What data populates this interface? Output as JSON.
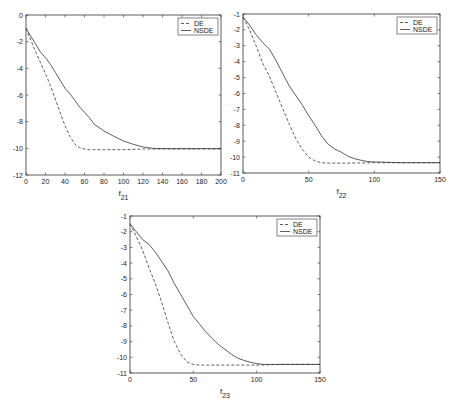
{
  "chart_data": [
    {
      "type": "line",
      "id": "f21",
      "xlabel": "f",
      "xlabel_sub": "21",
      "ylabel": "",
      "title": "",
      "xlim": [
        0,
        200
      ],
      "ylim": [
        -12,
        0
      ],
      "xticks": [
        0,
        20,
        40,
        60,
        80,
        100,
        120,
        140,
        160,
        180,
        200
      ],
      "yticks": [
        0,
        -2,
        -4,
        -6,
        -8,
        -10,
        -12
      ],
      "grid": false,
      "legend_position": "upper right",
      "box": {
        "left": 26,
        "top": 15,
        "right": 221,
        "bottom": 175
      },
      "series": [
        {
          "name": "DE",
          "style": "dashed",
          "x": [
            0,
            5,
            10,
            15,
            20,
            25,
            30,
            35,
            40,
            45,
            50,
            55,
            60,
            65,
            70,
            80,
            100,
            120,
            140,
            160,
            180,
            200
          ],
          "y": [
            -1.0,
            -1.9,
            -2.8,
            -3.6,
            -4.4,
            -5.3,
            -6.3,
            -7.3,
            -8.3,
            -9.1,
            -9.7,
            -9.95,
            -10.05,
            -10.1,
            -10.1,
            -10.1,
            -10.1,
            -10.05,
            -10.05,
            -10.05,
            -10.05,
            -10.05
          ]
        },
        {
          "name": "NSDE",
          "style": "solid",
          "x": [
            0,
            5,
            10,
            15,
            20,
            25,
            30,
            35,
            40,
            45,
            50,
            55,
            60,
            65,
            70,
            80,
            90,
            100,
            110,
            120,
            130,
            140,
            160,
            180,
            200
          ],
          "y": [
            -1.0,
            -1.6,
            -2.2,
            -2.8,
            -3.2,
            -3.7,
            -4.3,
            -4.9,
            -5.5,
            -5.9,
            -6.4,
            -6.9,
            -7.3,
            -7.7,
            -8.2,
            -8.7,
            -9.1,
            -9.45,
            -9.7,
            -9.9,
            -10.0,
            -10.02,
            -10.02,
            -10.02,
            -10.02
          ]
        }
      ]
    },
    {
      "type": "line",
      "id": "f22",
      "xlabel": "f",
      "xlabel_sub": "22",
      "ylabel": "",
      "title": "",
      "xlim": [
        0,
        150
      ],
      "ylim": [
        -11,
        -1
      ],
      "xticks": [
        0,
        50,
        100,
        150
      ],
      "yticks": [
        -1,
        -2,
        -3,
        -4,
        -5,
        -6,
        -7,
        -8,
        -9,
        -10,
        -11
      ],
      "grid": false,
      "legend_position": "upper right",
      "box": {
        "left": 243,
        "top": 14,
        "right": 440,
        "bottom": 173
      },
      "series": [
        {
          "name": "DE",
          "style": "dashed",
          "x": [
            0,
            5,
            10,
            15,
            20,
            25,
            30,
            35,
            40,
            45,
            50,
            55,
            60,
            65,
            70,
            80,
            100,
            120,
            150
          ],
          "y": [
            -1.2,
            -2.0,
            -3.0,
            -4.1,
            -4.9,
            -5.9,
            -6.9,
            -7.9,
            -8.8,
            -9.5,
            -10.0,
            -10.25,
            -10.35,
            -10.38,
            -10.38,
            -10.38,
            -10.35,
            -10.35,
            -10.35
          ]
        },
        {
          "name": "NSDE",
          "style": "solid",
          "x": [
            0,
            5,
            10,
            15,
            20,
            25,
            30,
            35,
            40,
            45,
            50,
            55,
            60,
            65,
            70,
            75,
            80,
            85,
            90,
            95,
            100,
            110,
            120,
            150
          ],
          "y": [
            -1.2,
            -1.7,
            -2.3,
            -2.8,
            -3.2,
            -3.9,
            -4.7,
            -5.5,
            -6.1,
            -6.7,
            -7.4,
            -8.0,
            -8.7,
            -9.2,
            -9.5,
            -9.7,
            -9.95,
            -10.1,
            -10.2,
            -10.28,
            -10.3,
            -10.33,
            -10.35,
            -10.35
          ]
        }
      ]
    },
    {
      "type": "line",
      "id": "f23",
      "xlabel": "f",
      "xlabel_sub": "23",
      "ylabel": "",
      "title": "",
      "xlim": [
        0,
        150
      ],
      "ylim": [
        -11,
        -1
      ],
      "xticks": [
        0,
        50,
        100,
        150
      ],
      "yticks": [
        -1,
        -2,
        -3,
        -4,
        -5,
        -6,
        -7,
        -8,
        -9,
        -10,
        -11
      ],
      "grid": false,
      "legend_position": "upper right",
      "box": {
        "left": 130,
        "top": 216,
        "right": 320,
        "bottom": 373
      },
      "series": [
        {
          "name": "DE",
          "style": "dashed",
          "x": [
            0,
            5,
            10,
            15,
            20,
            25,
            30,
            35,
            40,
            45,
            50,
            55,
            60,
            80,
            100,
            120,
            150
          ],
          "y": [
            -1.5,
            -2.3,
            -3.2,
            -4.3,
            -5.3,
            -6.5,
            -7.8,
            -9.0,
            -9.8,
            -10.3,
            -10.45,
            -10.5,
            -10.5,
            -10.5,
            -10.5,
            -10.45,
            -10.45
          ]
        },
        {
          "name": "NSDE",
          "style": "solid",
          "x": [
            0,
            5,
            10,
            15,
            20,
            25,
            30,
            35,
            40,
            45,
            50,
            55,
            60,
            65,
            70,
            75,
            80,
            85,
            90,
            95,
            100,
            105,
            110,
            120,
            150
          ],
          "y": [
            -1.5,
            -2.0,
            -2.5,
            -2.8,
            -3.3,
            -3.9,
            -4.5,
            -5.3,
            -6.0,
            -6.7,
            -7.4,
            -7.9,
            -8.4,
            -8.8,
            -9.2,
            -9.5,
            -9.8,
            -10.05,
            -10.2,
            -10.32,
            -10.4,
            -10.45,
            -10.45,
            -10.45,
            -10.45
          ]
        }
      ]
    }
  ],
  "legend": {
    "de_label": "DE",
    "nsde_label": "NSDE"
  }
}
